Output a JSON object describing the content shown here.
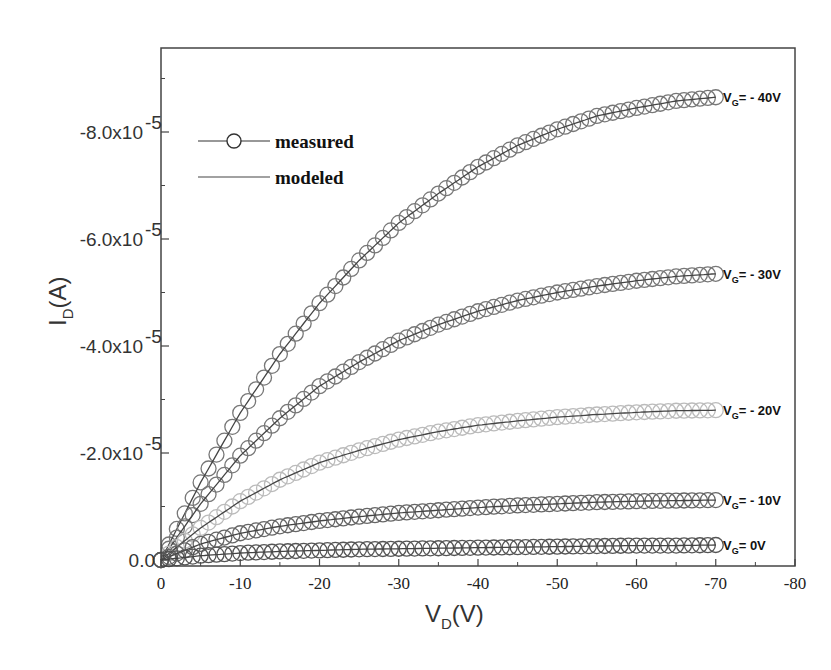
{
  "chart_data": {
    "type": "line",
    "title": "",
    "xlabel": "V_D(V)",
    "ylabel": "I_D(A)",
    "xlim": [
      0,
      -80
    ],
    "ylim": [
      0,
      -9.6e-05
    ],
    "x_ticks": [
      "0",
      "-10",
      "-20",
      "-30",
      "-40",
      "-50",
      "-60",
      "-70",
      "-80"
    ],
    "y_ticks": [
      "0.0",
      "-2.0x10-5",
      "-4.0x10-5",
      "-6.0x10-5",
      "-8.0x10-5"
    ],
    "grid": false,
    "legend": {
      "position": "upper-left",
      "entries": [
        "measured",
        "modeled"
      ]
    },
    "x": [
      0,
      -5,
      -10,
      -15,
      -20,
      -25,
      -30,
      -35,
      -40,
      -45,
      -50,
      -55,
      -60,
      -65,
      -70
    ],
    "series": [
      {
        "name": "V_G = - 40V",
        "label": "VG= - 40V",
        "color": "#777777",
        "values": [
          0,
          -1.45e-05,
          -2.75e-05,
          -3.85e-05,
          -4.8e-05,
          -5.6e-05,
          -6.3e-05,
          -6.85e-05,
          -7.35e-05,
          -7.75e-05,
          -8.05e-05,
          -8.3e-05,
          -8.45e-05,
          -8.58e-05,
          -8.65e-05
        ]
      },
      {
        "name": "V_G = - 30V",
        "label": "VG= - 30V",
        "color": "#777777",
        "values": [
          0,
          -1.05e-05,
          -1.95e-05,
          -2.65e-05,
          -3.25e-05,
          -3.7e-05,
          -4.1e-05,
          -4.4e-05,
          -4.65e-05,
          -4.85e-05,
          -5e-05,
          -5.12e-05,
          -5.22e-05,
          -5.3e-05,
          -5.35e-05
        ]
      },
      {
        "name": "V_G = - 20V",
        "label": "VG= - 20V",
        "color": "#bbbbbb",
        "values": [
          0,
          -6e-06,
          -1.1e-05,
          -1.5e-05,
          -1.82e-05,
          -2.05e-05,
          -2.25e-05,
          -2.4e-05,
          -2.52e-05,
          -2.6e-05,
          -2.67e-05,
          -2.72e-05,
          -2.76e-05,
          -2.79e-05,
          -2.8e-05
        ]
      },
      {
        "name": "V_G = - 10V",
        "label": "VG= - 10V",
        "color": "#666666",
        "values": [
          0,
          -3e-06,
          -5e-06,
          -6.3e-06,
          -7.3e-06,
          -8.1e-06,
          -8.8e-06,
          -9.3e-06,
          -9.8e-06,
          -1.02e-05,
          -1.05e-05,
          -1.08e-05,
          -1.1e-05,
          -1.11e-05,
          -1.12e-05
        ]
      },
      {
        "name": "V_G = 0V",
        "label": "VG= 0V",
        "color": "#555555",
        "values": [
          0,
          -8e-07,
          -1.3e-06,
          -1.6e-06,
          -1.8e-06,
          -2e-06,
          -2.1e-06,
          -2.2e-06,
          -2.3e-06,
          -2.4e-06,
          -2.5e-06,
          -2.6e-06,
          -2.7e-06,
          -2.7e-06,
          -2.8e-06
        ]
      }
    ],
    "annotations": [
      "VG= - 40V",
      "VG= - 30V",
      "VG= - 20V",
      "VG= - 10V",
      "VG= 0V"
    ]
  },
  "axes": {
    "y_ticks": [
      {
        "label": "0.0",
        "value": 0
      },
      {
        "label": "-2.0x10",
        "exp": "-5",
        "value": -2e-05
      },
      {
        "label": "-4.0x10",
        "exp": "-5",
        "value": -4e-05
      },
      {
        "label": "-6.0x10",
        "exp": "-5",
        "value": -6e-05
      },
      {
        "label": "-8.0x10",
        "exp": "-5",
        "value": -8e-05
      }
    ],
    "x_ticks": [
      "0",
      "-10",
      "-20",
      "-30",
      "-40",
      "-50",
      "-60",
      "-70",
      "-80"
    ],
    "xlabel_main": "V",
    "xlabel_sub": "D",
    "xlabel_rest": "(V)",
    "ylabel_main": "I",
    "ylabel_sub": "D",
    "ylabel_rest": "(A)"
  },
  "legend": {
    "measured": "measured",
    "modeled": "modeled"
  },
  "labels": [
    {
      "main": "V",
      "sub": "G",
      "rest": "= - 40V"
    },
    {
      "main": "V",
      "sub": "G",
      "rest": "= - 30V"
    },
    {
      "main": "V",
      "sub": "G",
      "rest": "= - 20V"
    },
    {
      "main": "V",
      "sub": "G",
      "rest": "= - 10V"
    },
    {
      "main": "V",
      "sub": "G",
      "rest": "= 0V"
    }
  ]
}
